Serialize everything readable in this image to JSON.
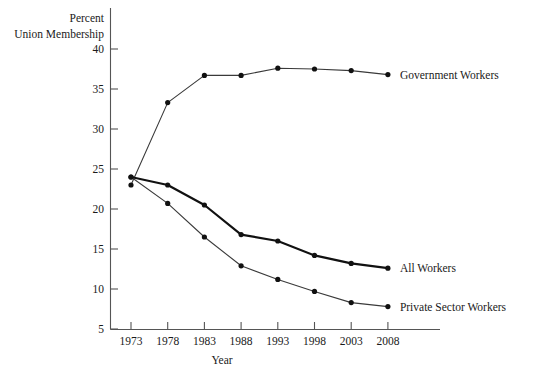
{
  "chart_data": {
    "type": "line",
    "title": "",
    "xlabel": "Year",
    "ylabel": "Percent Union Membership",
    "ylabel_line1": "Percent",
    "ylabel_line2": "Union Membership",
    "x": [
      1973,
      1978,
      1983,
      1988,
      1993,
      1998,
      2003,
      2008
    ],
    "categories": [
      "1973",
      "1978",
      "1983",
      "1988",
      "1993",
      "1998",
      "2003",
      "2008"
    ],
    "xlim": [
      1973,
      2008
    ],
    "ylim": [
      5,
      40
    ],
    "yticks": [
      5,
      10,
      15,
      20,
      25,
      30,
      35,
      40
    ],
    "ytick_labels": [
      "5",
      "10",
      "15",
      "20",
      "25",
      "30",
      "35",
      "40"
    ],
    "grid": false,
    "legend": "inline-right",
    "series": [
      {
        "name": "Government Workers",
        "label": "Government Workers",
        "color": "#3a3a3a",
        "width": "thin",
        "values": [
          23.0,
          33.3,
          36.7,
          36.7,
          37.6,
          37.5,
          37.3,
          36.8
        ]
      },
      {
        "name": "All Workers",
        "label": "All Workers",
        "color": "#111111",
        "width": "thick",
        "values": [
          24.0,
          23.0,
          20.5,
          16.8,
          16.0,
          14.2,
          13.2,
          12.6
        ]
      },
      {
        "name": "Private Sector Workers",
        "label": "Private Sector Workers",
        "color": "#3a3a3a",
        "width": "thin",
        "values": [
          24.0,
          20.7,
          16.5,
          12.9,
          11.2,
          9.7,
          8.3,
          7.8
        ]
      }
    ]
  }
}
